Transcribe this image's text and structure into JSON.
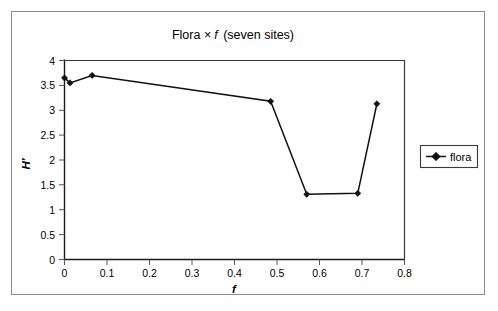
{
  "figure": {
    "title_prefix": "Flora ",
    "title_symbol": "×",
    "title_variable": "f",
    "title_suffix": " (seven sites)",
    "title_full": "Flora × f (seven sites)"
  },
  "legend": {
    "entries": [
      {
        "label": "flora",
        "marker": "diamond-marker",
        "color": "#111111"
      }
    ],
    "position": "right"
  },
  "axes": {
    "x_ticks": [
      "0",
      "0.1",
      "0.2",
      "0.3",
      "0.4",
      "0.5",
      "0.6",
      "0.7",
      "0.8"
    ],
    "y_ticks": [
      "0",
      "0.5",
      "1",
      "1.5",
      "2",
      "2.5",
      "3",
      "3.5",
      "4"
    ],
    "x_title": "f",
    "y_title": "H′"
  },
  "chart_data": {
    "type": "line",
    "xlabel": "f",
    "ylabel": "H′",
    "xlim": [
      0,
      0.8
    ],
    "ylim": [
      0,
      4
    ],
    "xticks": [
      0,
      0.1,
      0.2,
      0.3,
      0.4,
      0.5,
      0.6,
      0.7,
      0.8
    ],
    "yticks": [
      0,
      0.5,
      1,
      1.5,
      2,
      2.5,
      3,
      3.5,
      4
    ],
    "grid": false,
    "legend": [
      "flora"
    ],
    "legend_position": "right",
    "series": [
      {
        "name": "flora",
        "marker": "diamond",
        "color": "#111111",
        "x": [
          0.0,
          0.013,
          0.065,
          0.485,
          0.57,
          0.69,
          0.735
        ],
        "y": [
          3.65,
          3.55,
          3.7,
          3.18,
          1.31,
          1.33,
          3.13
        ],
        "points": [
          {
            "x": 0.0,
            "y": 3.65
          },
          {
            "x": 0.013,
            "y": 3.55
          },
          {
            "x": 0.065,
            "y": 3.7
          },
          {
            "x": 0.485,
            "y": 3.18
          },
          {
            "x": 0.57,
            "y": 1.31
          },
          {
            "x": 0.69,
            "y": 1.33
          },
          {
            "x": 0.735,
            "y": 3.13
          }
        ]
      }
    ]
  }
}
